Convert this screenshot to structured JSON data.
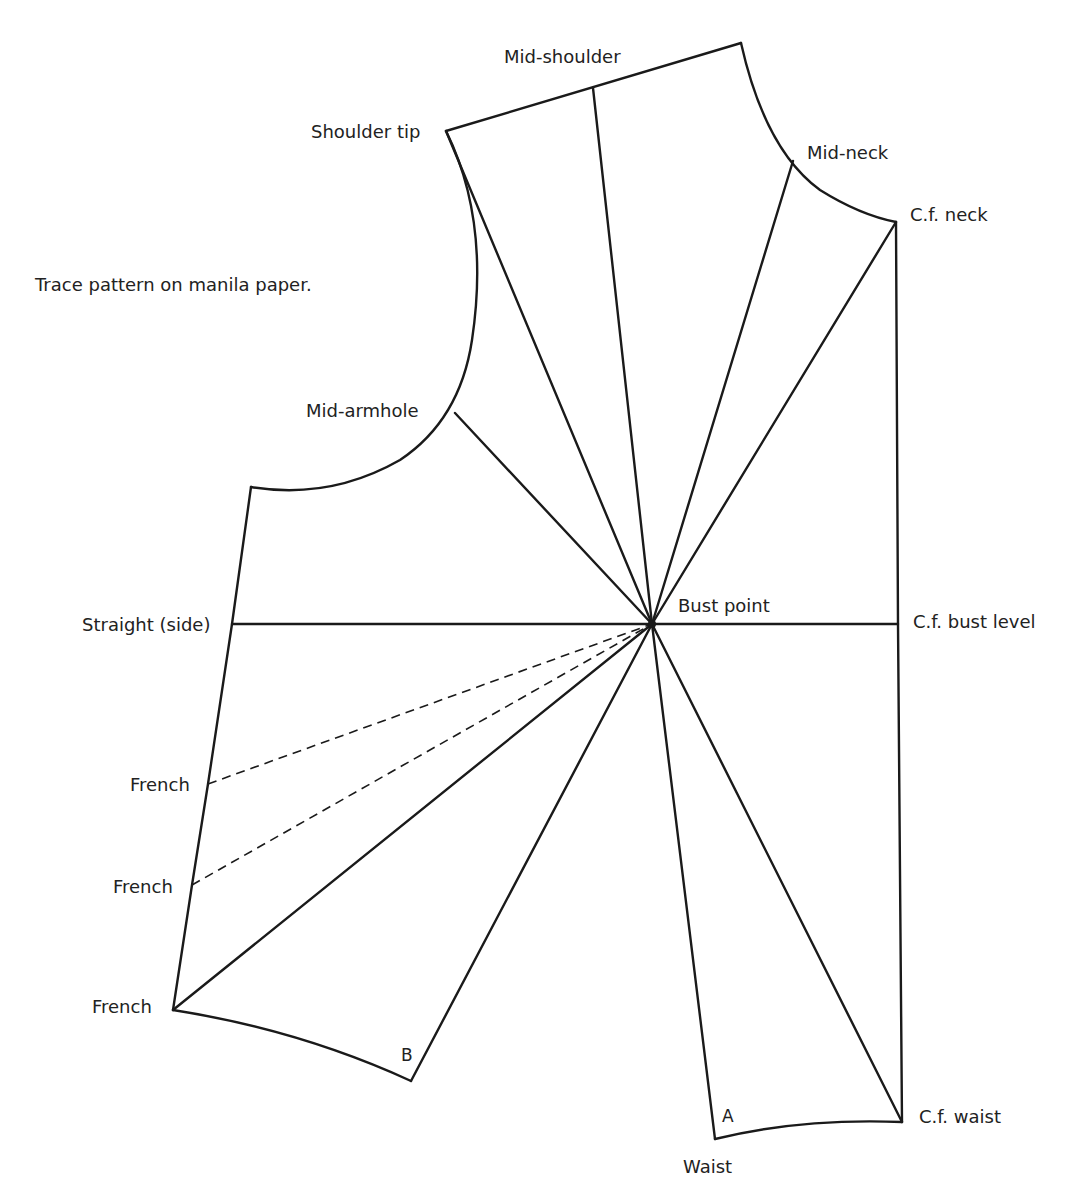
{
  "title_note": "Trace pattern on manila paper.",
  "labels": {
    "mid_shoulder": "Mid-shoulder",
    "shoulder_tip": "Shoulder tip",
    "mid_neck": "Mid-neck",
    "cf_neck": "C.f. neck",
    "mid_armhole": "Mid-armhole",
    "straight_side": "Straight (side)",
    "bust_point": "Bust point",
    "cf_bust_level": "C.f. bust level",
    "french_1": "French",
    "french_2": "French",
    "french_3": "French",
    "point_b": "B",
    "point_a": "A",
    "waist": "Waist",
    "cf_waist": "C.f. waist"
  },
  "colors": {
    "line": "#1a1a1a",
    "background": "#ffffff"
  }
}
